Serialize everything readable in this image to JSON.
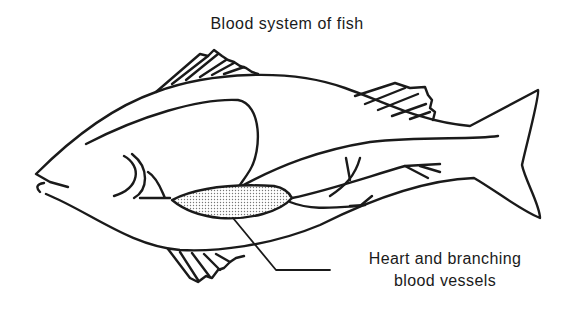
{
  "diagram": {
    "title": "Blood system of fish",
    "subject": "fish",
    "labels": [
      {
        "line1": "Heart and branching",
        "line2": "blood vessels",
        "points_to": "heart"
      }
    ],
    "colors": {
      "ink": "#1a1a1a",
      "background": "#ffffff",
      "heart_fill": "#d9d9d9"
    }
  }
}
